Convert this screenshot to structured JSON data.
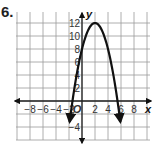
{
  "problem": {
    "number": "6."
  },
  "chart_data": {
    "type": "line",
    "title": "",
    "xlabel": "x",
    "ylabel": "y",
    "xlim": [
      -10,
      10
    ],
    "ylim": [
      -6,
      14
    ],
    "grid": true,
    "grid_step": 2,
    "x_tick_labels": [
      "−8",
      "−6",
      "−4",
      "−2",
      "O",
      "2",
      "4",
      "6",
      "8"
    ],
    "x_ticks": [
      -8,
      -6,
      -4,
      -2,
      0,
      2,
      4,
      6,
      8
    ],
    "y_tick_labels": [
      "2",
      "4",
      "6",
      "8",
      "10",
      "12",
      "−4"
    ],
    "y_ticks": [
      2,
      4,
      6,
      8,
      10,
      12,
      -4
    ],
    "origin_label": "O",
    "series": [
      {
        "name": "parabola",
        "equation": "y = -(x - 2)^2 + 12",
        "vertex": [
          2,
          12
        ],
        "y_intercept": 8,
        "x_intercepts": [
          -1.46,
          5.46
        ],
        "x": [
          -1.9,
          -1,
          0,
          1,
          2,
          3,
          4,
          5,
          5.9
        ],
        "y": [
          -3.2,
          3,
          8,
          11,
          12,
          11,
          8,
          3,
          -3.2
        ],
        "arrows_at_ends": true,
        "color": "#111111"
      }
    ]
  },
  "colors": {
    "grid": "#9a9a9a",
    "axis": "#222222",
    "curve": "#111111"
  }
}
